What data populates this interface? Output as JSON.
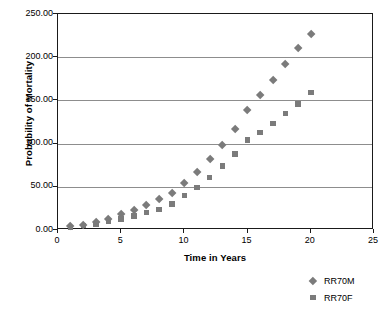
{
  "chart_data": {
    "type": "scatter",
    "title": "",
    "xlabel": "Time in Years",
    "ylabel": "Probability of Mortality",
    "xlim": [
      0,
      25
    ],
    "ylim": [
      0,
      250
    ],
    "xticks": [
      "0",
      "5",
      "10",
      "15",
      "20",
      "25"
    ],
    "xtick_values": [
      0,
      5,
      10,
      15,
      20,
      25
    ],
    "yticks": [
      "0.00",
      "50.00",
      "100.00",
      "150.00",
      "200.00",
      "250.00"
    ],
    "ytick_values": [
      0,
      50,
      100,
      150,
      200,
      250
    ],
    "grid": "horizontal",
    "legend_position": "bottom-right",
    "marker_color": "#7b7b7b",
    "x": [
      1,
      2,
      3,
      4,
      5,
      6,
      7,
      8,
      9,
      10,
      11,
      12,
      13,
      14,
      15,
      16,
      17,
      18,
      19,
      20
    ],
    "series": [
      {
        "name": "RR70M",
        "marker": "diamond",
        "values": [
          4,
          6,
          9,
          13,
          18,
          23,
          29,
          36,
          43,
          54,
          67,
          82,
          98,
          117,
          139,
          156,
          173,
          192,
          211,
          227
        ]
      },
      {
        "name": "RR70F",
        "marker": "square",
        "values": [
          3,
          5,
          7,
          10,
          13,
          16,
          20,
          24,
          30,
          40,
          49,
          61,
          74,
          88,
          104,
          113,
          123,
          135,
          146,
          159
        ]
      }
    ]
  },
  "legend": {
    "entries": [
      {
        "label": "RR70M",
        "marker": "diamond"
      },
      {
        "label": "RR70F",
        "marker": "square"
      }
    ]
  }
}
